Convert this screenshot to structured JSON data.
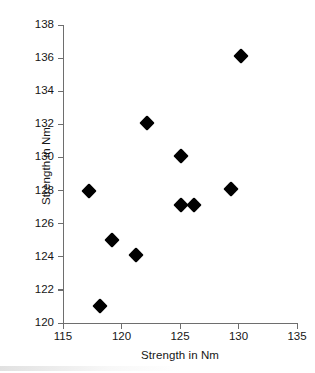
{
  "chart_data": {
    "type": "scatter",
    "title": "",
    "xlabel": "Strength in Nm",
    "ylabel": "Strength in Nm",
    "xlim": [
      115,
      135
    ],
    "ylim": [
      120,
      138
    ],
    "xticks": [
      115,
      120,
      125,
      130,
      135
    ],
    "yticks": [
      120,
      122,
      124,
      126,
      128,
      130,
      132,
      134,
      136,
      138
    ],
    "grid": false,
    "legend": null,
    "marker": "filled-diamond",
    "marker_color": "#000000",
    "axis_color": "#6e6e6e",
    "points": [
      {
        "x": 117.2,
        "y": 128.0
      },
      {
        "x": 118.2,
        "y": 121.0
      },
      {
        "x": 119.2,
        "y": 125.0
      },
      {
        "x": 121.2,
        "y": 124.1
      },
      {
        "x": 122.2,
        "y": 132.1
      },
      {
        "x": 125.1,
        "y": 130.1
      },
      {
        "x": 125.1,
        "y": 127.1
      },
      {
        "x": 126.2,
        "y": 127.1
      },
      {
        "x": 129.4,
        "y": 128.1
      },
      {
        "x": 130.2,
        "y": 136.1
      }
    ]
  }
}
